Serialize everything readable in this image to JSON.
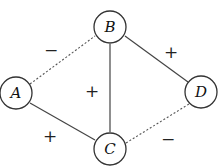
{
  "diagram": {
    "type": "signed-graph",
    "nodes": [
      {
        "id": "A",
        "label": "A",
        "x": 16,
        "y": 93
      },
      {
        "id": "B",
        "label": "B",
        "x": 110,
        "y": 27
      },
      {
        "id": "C",
        "label": "C",
        "x": 110,
        "y": 149
      },
      {
        "id": "D",
        "label": "D",
        "x": 201,
        "y": 92
      }
    ],
    "edges": [
      {
        "from": "A",
        "to": "B",
        "sign": "−",
        "style": "dashed"
      },
      {
        "from": "B",
        "to": "D",
        "sign": "+",
        "style": "solid"
      },
      {
        "from": "B",
        "to": "C",
        "sign": "+",
        "style": "solid"
      },
      {
        "from": "A",
        "to": "C",
        "sign": "+",
        "style": "solid"
      },
      {
        "from": "C",
        "to": "D",
        "sign": "−",
        "style": "dashed"
      }
    ],
    "signs": {
      "ab": "−",
      "bd": "+",
      "bc": "+",
      "ac": "+",
      "cd": "−"
    }
  }
}
